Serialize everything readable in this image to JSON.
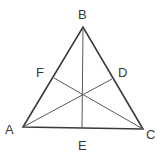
{
  "diagram": {
    "type": "triangle-medians",
    "colors": {
      "stroke": "#3a3a3a",
      "median": "#5a5a5a",
      "label": "#3a3a3a",
      "background": "#ffffff"
    },
    "vertices": {
      "A": {
        "label": "A",
        "x": 23,
        "y": 127
      },
      "B": {
        "label": "B",
        "x": 83,
        "y": 27
      },
      "C": {
        "label": "C",
        "x": 143,
        "y": 129
      }
    },
    "midpoints": {
      "D": {
        "label": "D",
        "x": 112,
        "y": 79,
        "on": "BC"
      },
      "E": {
        "label": "E",
        "x": 82,
        "y": 128,
        "on": "AC"
      },
      "F": {
        "label": "F",
        "x": 54,
        "y": 78,
        "on": "AB"
      }
    },
    "medians": [
      "AD",
      "BE",
      "CF"
    ],
    "labels": {
      "A": "A",
      "B": "B",
      "C": "C",
      "D": "D",
      "E": "E",
      "F": "F"
    }
  }
}
